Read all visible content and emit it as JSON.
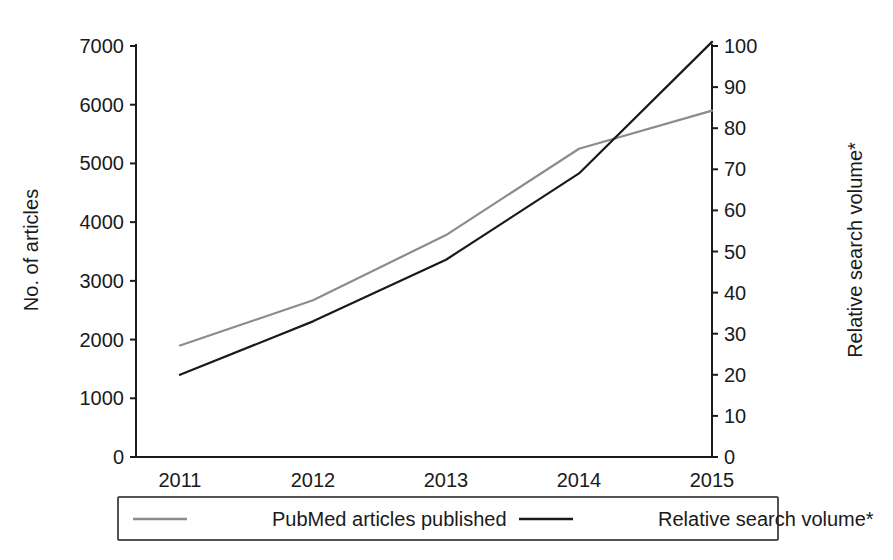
{
  "chart_data": {
    "type": "line",
    "title": "",
    "subtitle": "",
    "xlabel": "",
    "ylabel": "No. of articles",
    "y2label": "Relative search volume*",
    "x": [
      "2011",
      "2012",
      "2013",
      "2014",
      "2015"
    ],
    "categories": [
      "2011",
      "2012",
      "2013",
      "2014",
      "2015"
    ],
    "xlim": [
      2011,
      2015
    ],
    "ylim": [
      0,
      7000
    ],
    "y2lim": [
      0,
      100
    ],
    "yticks": [
      0,
      1000,
      2000,
      3000,
      4000,
      5000,
      6000,
      7000
    ],
    "ytick_labels": [
      "0",
      "1000",
      "2000",
      "3000",
      "4000",
      "5000",
      "6000",
      "7000"
    ],
    "y2ticks": [
      0,
      10,
      20,
      30,
      40,
      50,
      60,
      70,
      80,
      90,
      100
    ],
    "y2tick_labels": [
      "0",
      "10",
      "20",
      "30",
      "40",
      "50",
      "60",
      "70",
      "80",
      "90",
      "100"
    ],
    "xtick_labels": [
      "2011",
      "2012",
      "2013",
      "2014",
      "2015"
    ],
    "grid": false,
    "legend_position": "bottom",
    "series": [
      {
        "name": "PubMed articles published",
        "axis": "left",
        "color": "#8c8c8c",
        "line_width": 2.2,
        "values": [
          1900,
          2670,
          3780,
          5250,
          5900
        ]
      },
      {
        "name": "Relative search volume*",
        "axis": "right",
        "color": "#1a1a1a",
        "line_width": 2.2,
        "values": [
          20,
          33,
          48,
          69,
          101
        ]
      }
    ],
    "annotations": []
  },
  "legend": {
    "items": [
      {
        "label": "PubMed articles published",
        "color": "#8c8c8c"
      },
      {
        "label": "Relative search volume*",
        "color": "#1a1a1a"
      }
    ]
  },
  "axes": {
    "left_title": "No. of articles",
    "right_title": "Relative search volume*"
  },
  "colors": {
    "series_gray": "#8c8c8c",
    "series_black": "#1a1a1a",
    "axis": "#1a1a1a",
    "background": "#ffffff"
  }
}
